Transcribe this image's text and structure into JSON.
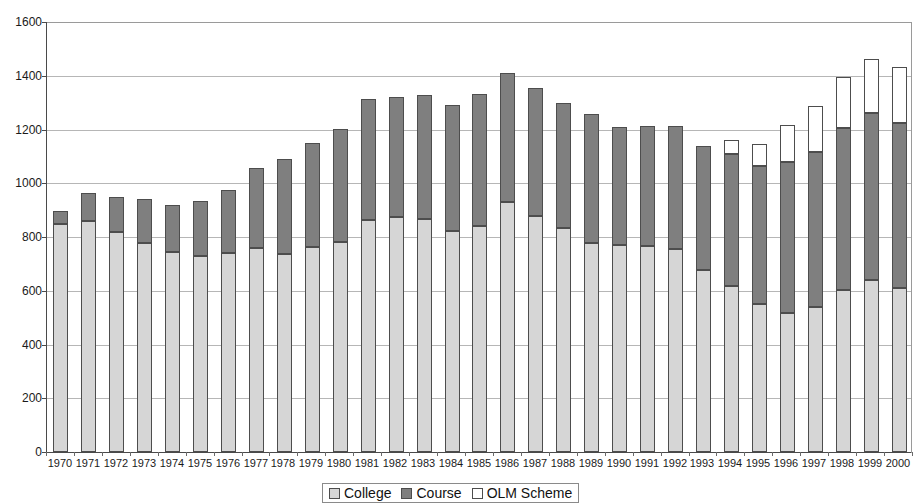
{
  "chart_data": {
    "type": "bar",
    "subtype": "stacked",
    "title": "",
    "xlabel": "",
    "ylabel": "",
    "ylim": [
      0,
      1600
    ],
    "ytick_step": 200,
    "yticks": [
      0,
      200,
      400,
      600,
      800,
      1000,
      1200,
      1400,
      1600
    ],
    "grid": true,
    "legend_position": "bottom",
    "categories": [
      "1970",
      "1971",
      "1972",
      "1973",
      "1974",
      "1975",
      "1976",
      "1977",
      "1978",
      "1979",
      "1980",
      "1981",
      "1982",
      "1983",
      "1984",
      "1985",
      "1986",
      "1987",
      "1988",
      "1989",
      "1990",
      "1991",
      "1992",
      "1993",
      "1994",
      "1995",
      "1996",
      "1997",
      "1998",
      "1999",
      "2000"
    ],
    "series": [
      {
        "name": "College",
        "color": "#d6d6d6",
        "values": [
          850,
          858,
          820,
          778,
          745,
          728,
          742,
          760,
          735,
          762,
          782,
          865,
          875,
          868,
          822,
          842,
          930,
          880,
          835,
          778,
          770,
          765,
          755,
          678,
          618,
          552,
          518,
          538,
          602,
          640,
          612
        ]
      },
      {
        "name": "Course",
        "color": "#7f7f7f",
        "values": [
          48,
          105,
          128,
          162,
          175,
          205,
          232,
          298,
          355,
          388,
          420,
          450,
          445,
          462,
          470,
          492,
          482,
          475,
          465,
          478,
          440,
          448,
          458,
          462,
          490,
          512,
          562,
          578,
          602,
          622,
          612
        ]
      },
      {
        "name": "OLM Scheme",
        "color": "#ffffff",
        "values": [
          0,
          0,
          0,
          0,
          0,
          0,
          0,
          0,
          0,
          0,
          0,
          0,
          0,
          0,
          0,
          0,
          0,
          0,
          0,
          0,
          0,
          0,
          0,
          0,
          52,
          82,
          135,
          172,
          192,
          202,
          208
        ]
      }
    ],
    "totals": [
      898,
      963,
      948,
      940,
      920,
      933,
      974,
      1058,
      1090,
      1150,
      1202,
      1315,
      1320,
      1330,
      1292,
      1334,
      1412,
      1355,
      1300,
      1256,
      1210,
      1213,
      1213,
      1140,
      1160,
      1146,
      1215,
      1288,
      1396,
      1464,
      1432
    ]
  },
  "legend": {
    "items": [
      {
        "label": "College",
        "swatch": "sw-college"
      },
      {
        "label": "Course",
        "swatch": "sw-course"
      },
      {
        "label": "OLM Scheme",
        "swatch": "sw-olm"
      }
    ]
  }
}
